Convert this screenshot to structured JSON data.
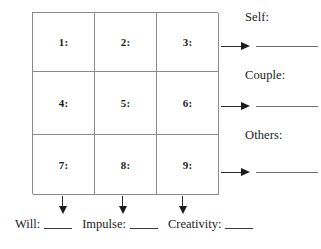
{
  "worksheet": {
    "grid": {
      "rows": [
        [
          {
            "label": "1:"
          },
          {
            "label": "2:"
          },
          {
            "label": "3:"
          }
        ],
        [
          {
            "label": "4:"
          },
          {
            "label": "5:"
          },
          {
            "label": "6:"
          }
        ],
        [
          {
            "label": "7:"
          },
          {
            "label": "8:"
          },
          {
            "label": "9:"
          }
        ]
      ]
    },
    "row_outputs": [
      {
        "label": "Self:",
        "value": ""
      },
      {
        "label": "Couple:",
        "value": ""
      },
      {
        "label": "Others:",
        "value": ""
      }
    ],
    "column_outputs": [
      {
        "label": "Will:",
        "value": ""
      },
      {
        "label": "Impulse:",
        "value": ""
      },
      {
        "label": "Creativity:",
        "value": ""
      }
    ],
    "colors": {
      "grid_line": "#8a8a8a",
      "arrow": "#1b1b1b",
      "rule": "#6f6f6f",
      "text": "#1b1b1b",
      "background": "#ffffff"
    }
  }
}
